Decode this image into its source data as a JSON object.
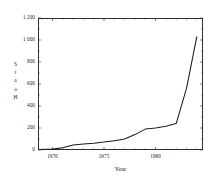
{
  "chart_data": {
    "type": "line",
    "title": "",
    "xlabel": "Year",
    "ylabel": "Stations",
    "ylabel_chars": [
      "S",
      "t",
      "a",
      "o",
      "H"
    ],
    "xlim": [
      1968.6,
      1984.6
    ],
    "ylim": [
      0,
      1200
    ],
    "grid": false,
    "legend": null,
    "line_color": "#1a1a1a",
    "background_color": "#ffffff",
    "axis_color": "#303030",
    "yticks": [
      0,
      200,
      400,
      600,
      800,
      1000,
      1200
    ],
    "ytick_labels": [
      "0",
      "200",
      "400",
      "600",
      "800",
      "1 000",
      "1 200"
    ],
    "xticks": [
      1970,
      1975,
      1980
    ],
    "xtick_labels": [
      "1970",
      "1975",
      "1980"
    ],
    "xminor_step": 1,
    "series": [
      {
        "name": "Stations",
        "x": [
          1969,
          1970,
          1971,
          1972,
          1973,
          1974,
          1975,
          1976,
          1977,
          1978,
          1979,
          1980,
          1981,
          1982,
          1983,
          1984
        ],
        "values": [
          5,
          8,
          20,
          45,
          55,
          62,
          72,
          85,
          100,
          140,
          190,
          200,
          215,
          240,
          560,
          1030
        ]
      }
    ]
  }
}
